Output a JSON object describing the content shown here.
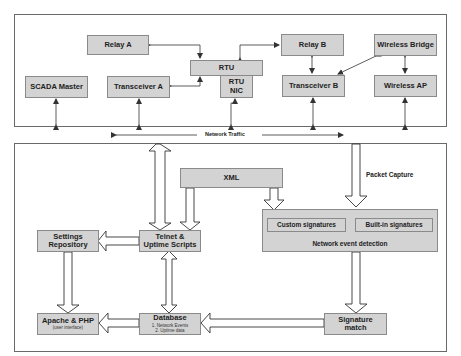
{
  "top_section": {
    "nodes": {
      "relay_a": "Relay A",
      "rtu": "RTU",
      "rtu_nic_line1": "RTU",
      "rtu_nic_line2": "NIC",
      "scada_master": "SCADA Master",
      "transceiver_a": "Transceiver A",
      "relay_b": "Relay B",
      "wireless_bridge": "Wireless Bridge",
      "transceiver_b": "Transceiver B",
      "wireless_ap": "Wireless AP"
    }
  },
  "network_band": {
    "label": "Network Traffic"
  },
  "bottom_section": {
    "packet_capture_label": "Packet Capture",
    "nodes": {
      "xml": "XML",
      "network_event_detection": "Network event detection",
      "custom_signatures": "Custom signatures",
      "builtin_signatures": "Built-in signatures",
      "telnet_line1": "Telnet &",
      "telnet_line2": "Uptime Scripts",
      "settings_line1": "Settings",
      "settings_line2": "Repository",
      "apache_title": "Apache & PHP",
      "apache_sub": "(user interface)",
      "database_title": "Database",
      "database_item1": "1. Network Events",
      "database_item2": "2. Uptime data",
      "signature_line1": "Signature",
      "signature_line2": "match"
    }
  },
  "colors": {
    "box_fill": "#d3d3d3",
    "box_border": "#8a8a8a",
    "line": "#333333",
    "frame": "#6a6a6a"
  }
}
